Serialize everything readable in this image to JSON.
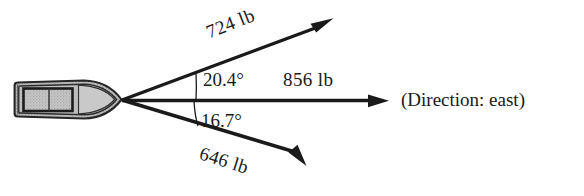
{
  "figure": {
    "type": "vector-force-diagram",
    "background_color": "#ffffff",
    "ink_color": "#1a1a1a"
  },
  "boat": {
    "name": "boat-top-view",
    "orientation": "pointing-east",
    "hull_fill": "#b9b9b9",
    "deck_fill": "#cccccc",
    "outline_color": "#1a1a1a"
  },
  "origin": {
    "x": 122,
    "y": 100
  },
  "vectors": [
    {
      "id": "upper",
      "label": "724 lb",
      "magnitude": 724,
      "unit": "lb",
      "angle_deg": 20.4,
      "direction": "north of east",
      "tip": {
        "x": 333,
        "y": 18
      },
      "label_rotation_deg": -21.5
    },
    {
      "id": "resultant",
      "label": "856 lb",
      "magnitude": 856,
      "unit": "lb",
      "angle_deg": 0,
      "direction": "east",
      "tip": {
        "x": 389,
        "y": 101
      },
      "label_rotation_deg": 0
    },
    {
      "id": "lower",
      "label": "646 lb",
      "magnitude": 646,
      "unit": "lb",
      "angle_deg": -16.7,
      "direction": "south of east",
      "tip": {
        "x": 306,
        "y": 166
      },
      "label_rotation_deg": 17.5
    }
  ],
  "angles": [
    {
      "id": "upper-angle",
      "label": "20.4°",
      "value": 20.4,
      "between": [
        "upper",
        "resultant"
      ]
    },
    {
      "id": "lower-angle",
      "label": "16.7°",
      "value": 16.7,
      "between": [
        "resultant",
        "lower"
      ]
    }
  ],
  "annotations": {
    "direction_note": "(Direction:  east)"
  }
}
